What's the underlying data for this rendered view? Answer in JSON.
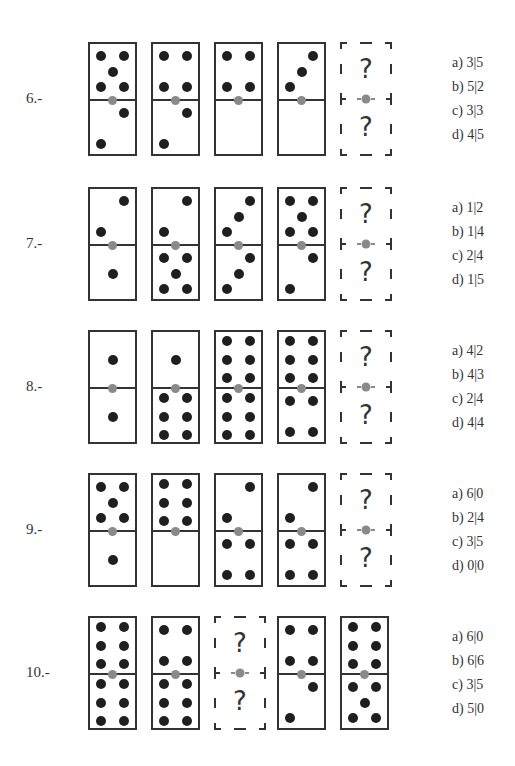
{
  "questions": [
    {
      "number": "6.-",
      "dominoes": [
        {
          "top": 5,
          "bottom": 2
        },
        {
          "top": 4,
          "bottom": 2
        },
        {
          "top": 4,
          "bottom": 0
        },
        {
          "top": 3,
          "bottom": 0
        },
        {
          "unknown": true,
          "top_label": "?",
          "bottom_label": "?"
        }
      ],
      "options": [
        "a) 3|5",
        "b) 5|2",
        "c) 3|3",
        "d) 4|5"
      ]
    },
    {
      "number": "7.-",
      "dominoes": [
        {
          "top": 2,
          "bottom": 1
        },
        {
          "top": 2,
          "bottom": 5
        },
        {
          "top": 3,
          "bottom": 3
        },
        {
          "top": 5,
          "bottom": 2
        },
        {
          "unknown": true,
          "top_label": "?",
          "bottom_label": "?"
        }
      ],
      "options": [
        "a) 1|2",
        "b) 1|4",
        "c) 2|4",
        "d) 1|5"
      ]
    },
    {
      "number": "8.-",
      "dominoes": [
        {
          "top": 1,
          "bottom": 1
        },
        {
          "top": 1,
          "bottom": 6
        },
        {
          "top": 6,
          "bottom": 6
        },
        {
          "top": 6,
          "bottom": 4
        },
        {
          "unknown": true,
          "top_label": "?",
          "bottom_label": "?"
        }
      ],
      "options": [
        "a) 4|2",
        "b) 4|3",
        "c) 2|4",
        "d) 4|4"
      ]
    },
    {
      "number": "9.-",
      "dominoes": [
        {
          "top": 5,
          "bottom": 1
        },
        {
          "top": 6,
          "bottom": 0
        },
        {
          "top": 2,
          "bottom": 4
        },
        {
          "top": 2,
          "bottom": 4
        },
        {
          "unknown": true,
          "top_label": "?",
          "bottom_label": "?"
        }
      ],
      "options": [
        "a) 6|0",
        "b) 2|4",
        "c) 3|5",
        "d) 0|0"
      ]
    },
    {
      "number": "10.-",
      "dominoes": [
        {
          "top": 6,
          "bottom": 6
        },
        {
          "top": 4,
          "bottom": 6
        },
        {
          "unknown": true,
          "top_label": "?",
          "bottom_label": "?"
        },
        {
          "top": 4,
          "bottom": 2
        },
        {
          "top": 6,
          "bottom": 5
        }
      ],
      "options": [
        "a) 6|0",
        "b) 6|6",
        "c) 3|5",
        "d) 5|0"
      ]
    }
  ],
  "colors": {
    "pip": "#1f1f1f",
    "border": "#333333",
    "pivot": "#8a8a8a"
  }
}
